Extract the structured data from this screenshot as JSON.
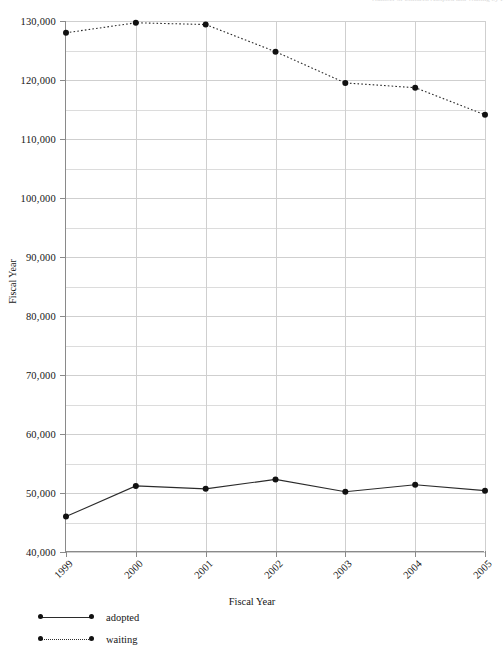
{
  "top_fragment": "Number of Children Adopted and Waiting by Fiscal Year",
  "axes": {
    "y_title": "Fiscal Year",
    "x_title": "Fiscal Year",
    "y_ticks": [
      "40,000",
      "50,000",
      "60,000",
      "70,000",
      "80,000",
      "90,000",
      "100,000",
      "110,000",
      "120,000",
      "130,000"
    ],
    "x_ticks": [
      "1999",
      "2000",
      "2001",
      "2002",
      "2003",
      "2004",
      "2005"
    ]
  },
  "legend": {
    "items": [
      {
        "label": "adopted",
        "style": "solid",
        "color": "#2b2b2b"
      },
      {
        "label": "waiting",
        "style": "dotted",
        "color": "#2b2b2b"
      }
    ]
  },
  "chart_data": {
    "type": "line",
    "title": "",
    "xlabel": "Fiscal Year",
    "ylabel": "Fiscal Year",
    "categories": [
      "1999",
      "2000",
      "2001",
      "2002",
      "2003",
      "2004",
      "2005"
    ],
    "x": [
      1999,
      2000,
      2001,
      2002,
      2003,
      2004,
      2005
    ],
    "ylim": [
      40000,
      130000
    ],
    "y_major_step": 10000,
    "y_minor_step": 5000,
    "grid": true,
    "legend_position": "bottom-left",
    "series": [
      {
        "name": "adopted",
        "style": "solid",
        "marker": "circle",
        "color": "#2b2b2b",
        "values": [
          46000,
          51200,
          50700,
          52300,
          50200,
          51400,
          50400
        ]
      },
      {
        "name": "waiting",
        "style": "dotted",
        "marker": "circle",
        "color": "#2b2b2b",
        "values": [
          128000,
          129700,
          129400,
          124800,
          119500,
          118700,
          114100
        ]
      }
    ]
  }
}
